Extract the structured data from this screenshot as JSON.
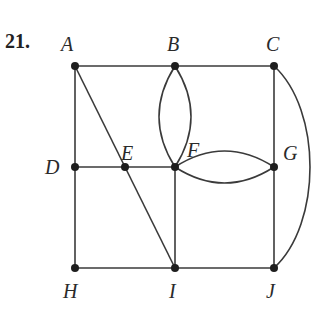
{
  "problem": {
    "number": "21."
  },
  "graph": {
    "vertices": [
      {
        "id": "A",
        "label": "A",
        "x": 75,
        "y": 66
      },
      {
        "id": "B",
        "label": "B",
        "x": 175,
        "y": 66
      },
      {
        "id": "C",
        "label": "C",
        "x": 274,
        "y": 66
      },
      {
        "id": "D",
        "label": "D",
        "x": 75,
        "y": 167
      },
      {
        "id": "E",
        "label": "E",
        "x": 125,
        "y": 167
      },
      {
        "id": "F",
        "label": "F",
        "x": 175,
        "y": 167
      },
      {
        "id": "G",
        "label": "G",
        "x": 274,
        "y": 167
      },
      {
        "id": "H",
        "label": "H",
        "x": 75,
        "y": 268
      },
      {
        "id": "I",
        "label": "I",
        "x": 175,
        "y": 268
      },
      {
        "id": "J",
        "label": "J",
        "x": 274,
        "y": 268
      }
    ],
    "edges": [
      {
        "from": "A",
        "to": "B",
        "type": "straight"
      },
      {
        "from": "B",
        "to": "C",
        "type": "straight"
      },
      {
        "from": "A",
        "to": "D",
        "type": "straight"
      },
      {
        "from": "D",
        "to": "H",
        "type": "straight"
      },
      {
        "from": "A",
        "to": "I",
        "type": "straight",
        "note": "diagonal through E"
      },
      {
        "from": "D",
        "to": "E",
        "type": "straight"
      },
      {
        "from": "E",
        "to": "F",
        "type": "straight"
      },
      {
        "from": "B",
        "to": "F",
        "type": "curved-left"
      },
      {
        "from": "B",
        "to": "F",
        "type": "curved-right"
      },
      {
        "from": "F",
        "to": "G",
        "type": "curved-up"
      },
      {
        "from": "F",
        "to": "G",
        "type": "curved-down"
      },
      {
        "from": "F",
        "to": "I",
        "type": "straight"
      },
      {
        "from": "C",
        "to": "G",
        "type": "straight"
      },
      {
        "from": "G",
        "to": "J",
        "type": "straight"
      },
      {
        "from": "C",
        "to": "J",
        "type": "outer-arc"
      },
      {
        "from": "H",
        "to": "I",
        "type": "straight"
      },
      {
        "from": "I",
        "to": "J",
        "type": "straight"
      }
    ]
  },
  "labels": {
    "A": "A",
    "B": "B",
    "C": "C",
    "D": "D",
    "E": "E",
    "F": "F",
    "G": "G",
    "H": "H",
    "I": "I",
    "J": "J"
  }
}
